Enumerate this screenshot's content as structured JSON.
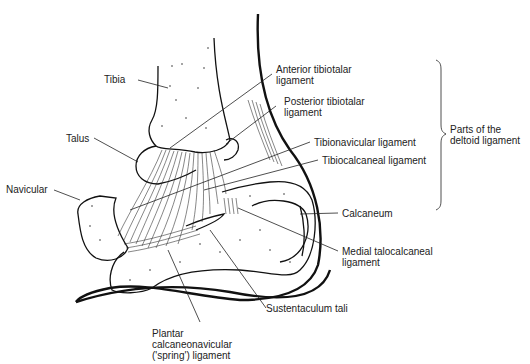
{
  "diagram": {
    "labels": {
      "tibia": "Tibia",
      "talus": "Talus",
      "navicular": "Navicular",
      "anterior_tibiotalar": "Anterior tibiotalar\nligament",
      "posterior_tibiotalar": "Posterior tibiotalar\nligament",
      "tibionavicular": "Tibionavicular ligament",
      "tibiocalcaneal": "Tibiocalcaneal ligament",
      "calcaneum": "Calcaneum",
      "medial_talocalcaneal": "Medial talocalcaneal\nligament",
      "sustentaculum_tali": "Sustentaculum tali",
      "spring_ligament": "Plantar\ncalcaneonavicular\n('spring') ligament",
      "deltoid_group": "Parts of the\ndeltoid ligament"
    }
  }
}
